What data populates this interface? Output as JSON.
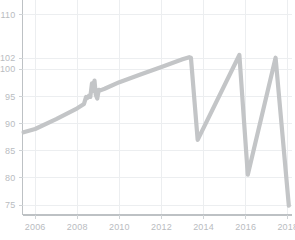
{
  "chart": {
    "title": "",
    "width": 295,
    "height": 240
  },
  "chart_data": {
    "type": "line",
    "title": "",
    "subtitle": "",
    "xlabel": "",
    "ylabel": "",
    "grid": true,
    "legend": false,
    "legend_position": "none",
    "line_color": "#c3c5c7",
    "grid_color": "#eceef0",
    "axis_color": "#bdc1c4",
    "tick_label_color": "#b9bcbf",
    "xlim": [
      2005.4,
      2018.2
    ],
    "ylim": [
      73.2,
      111.6
    ],
    "xticks": [
      2006,
      2008,
      2010,
      2012,
      2014,
      2016,
      2018
    ],
    "xtick_labels": [
      "2006",
      "2008",
      "2010",
      "2012",
      "2014",
      "2016",
      "2018"
    ],
    "yticks": [
      75,
      80,
      85,
      90,
      95,
      100,
      102,
      110
    ],
    "ytick_labels": [
      "75",
      "80",
      "85",
      "90",
      "95",
      "100",
      "102",
      "110"
    ],
    "series": [
      {
        "name": "value",
        "x": [
          2005.45,
          2006.0,
          2007.0,
          2008.0,
          2008.32,
          2008.42,
          2008.48,
          2008.55,
          2008.62,
          2008.7,
          2008.76,
          2008.82,
          2008.88,
          2008.95,
          2009.02,
          2009.1,
          2009.3,
          2010.0,
          2011.0,
          2012.0,
          2013.0,
          2013.32,
          2013.4,
          2013.72,
          2015.7,
          2016.1,
          2017.42,
          2018.05
        ],
        "y": [
          88.4,
          89.0,
          90.8,
          92.8,
          93.6,
          94.9,
          94.7,
          95.1,
          94.9,
          97.4,
          96.0,
          97.9,
          95.3,
          94.6,
          96.2,
          96.1,
          96.4,
          97.6,
          99.0,
          100.4,
          101.8,
          102.2,
          102.1,
          87.0,
          102.6,
          80.6,
          102.1,
          74.9
        ]
      }
    ]
  }
}
